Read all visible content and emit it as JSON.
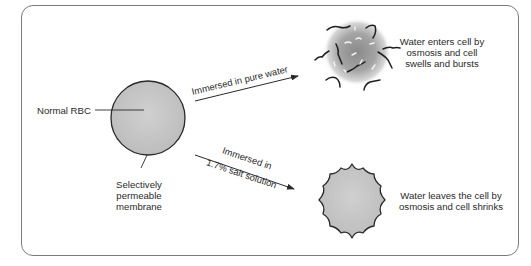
{
  "diagram": {
    "normal_cell": {
      "label": "Normal RBC",
      "membrane_label_lines": [
        "Selectively",
        "permeable",
        "membrane"
      ]
    },
    "pure_water_branch": {
      "arrow_label": "Immersed in pure water",
      "result_lines": [
        "Water enters cell by",
        "osmosis and cell",
        "swells and bursts"
      ]
    },
    "salt_branch": {
      "arrow_label_lines": [
        "Immersed in",
        "1.7% salt solution"
      ],
      "result_lines": [
        "Water leaves the cell by",
        "osmosis and cell shrinks"
      ]
    },
    "colors": {
      "cell_fill": "#c8c8c8",
      "outline": "#2a2a2a",
      "frame": "#7a7a7a",
      "burst_core": "#8c8c8c"
    }
  }
}
